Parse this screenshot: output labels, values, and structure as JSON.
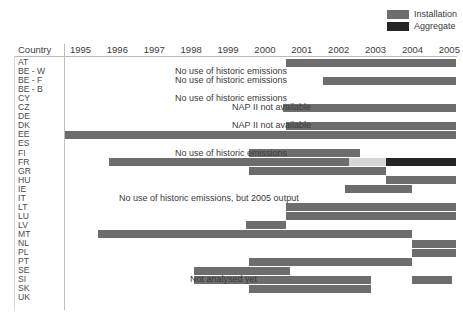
{
  "legend": {
    "items": [
      {
        "label": "Installation",
        "color": "#6d6d6d",
        "key": "installation"
      },
      {
        "label": "Aggregate",
        "color": "#252525",
        "key": "aggregate"
      }
    ]
  },
  "axis": {
    "country_header": "Country",
    "years": [
      "1995",
      "1996",
      "1997",
      "1998",
      "1999",
      "2000",
      "2001",
      "2002",
      "2003",
      "2004",
      "2005"
    ],
    "x_min": 1995,
    "x_max": 2005.6
  },
  "chart_data": {
    "type": "bar",
    "orientation": "horizontal-gantt",
    "title": "",
    "xlabel": "",
    "ylabel": "Country",
    "xlim": [
      1995,
      2005.6
    ],
    "grid": false,
    "legend_position": "top-right",
    "categories": [
      "AT",
      "BE - W",
      "BE - F",
      "BE - B",
      "CY",
      "CZ",
      "DE",
      "DK",
      "EE",
      "ES",
      "FI",
      "FR",
      "GR",
      "HU",
      "IE",
      "IT",
      "LT",
      "LU",
      "LV",
      "MT",
      "NL",
      "PL",
      "PT",
      "SE",
      "SI",
      "SK",
      "UK"
    ],
    "series": [
      {
        "name": "Installation",
        "color": "#6d6d6d"
      },
      {
        "name": "Aggregate",
        "color": "#252525"
      },
      {
        "name": "Light",
        "color": "#d6d6d6"
      }
    ],
    "bars": [
      {
        "country": "AT",
        "start": 2001.0,
        "end": 2005.6,
        "series": "Installation"
      },
      {
        "country": "BE - F",
        "start": 2002.0,
        "end": 2005.6,
        "series": "Installation"
      },
      {
        "country": "CZ",
        "start": 2000.9,
        "end": 2005.6,
        "series": "Installation"
      },
      {
        "country": "DK",
        "start": 2001.0,
        "end": 2005.6,
        "series": "Installation"
      },
      {
        "country": "EE",
        "start": 1995.0,
        "end": 2005.6,
        "series": "Installation"
      },
      {
        "country": "FI",
        "start": 2000.0,
        "end": 2003.0,
        "series": "Installation"
      },
      {
        "country": "FR",
        "start": 1996.2,
        "end": 2000.0,
        "series": "Installation"
      },
      {
        "country": "FR",
        "start": 2000.0,
        "end": 2002.7,
        "series": "Installation"
      },
      {
        "country": "FR",
        "start": 2002.7,
        "end": 2003.7,
        "series": "Light"
      },
      {
        "country": "FR",
        "start": 2003.7,
        "end": 2005.6,
        "series": "Aggregate"
      },
      {
        "country": "GR",
        "start": 2000.0,
        "end": 2003.7,
        "series": "Installation"
      },
      {
        "country": "HU",
        "start": 2003.7,
        "end": 2005.6,
        "series": "Installation"
      },
      {
        "country": "IE",
        "start": 2002.6,
        "end": 2004.4,
        "series": "Installation"
      },
      {
        "country": "LT",
        "start": 2001.0,
        "end": 2005.6,
        "series": "Installation"
      },
      {
        "country": "LU",
        "start": 2001.0,
        "end": 2005.6,
        "series": "Installation"
      },
      {
        "country": "LV",
        "start": 1999.9,
        "end": 2001.0,
        "series": "Installation"
      },
      {
        "country": "MT",
        "start": 1995.9,
        "end": 2004.4,
        "series": "Installation"
      },
      {
        "country": "MT",
        "start": 1999.9,
        "end": 2001.0,
        "series": "Installation"
      },
      {
        "country": "NL",
        "start": 2004.4,
        "end": 2005.6,
        "series": "Installation"
      },
      {
        "country": "PL",
        "start": 2004.4,
        "end": 2005.6,
        "series": "Installation"
      },
      {
        "country": "PT",
        "start": 2000.0,
        "end": 2004.4,
        "series": "Installation"
      },
      {
        "country": "SE",
        "start": 1998.5,
        "end": 2001.1,
        "series": "Installation"
      },
      {
        "country": "SI",
        "start": 1998.5,
        "end": 2003.3,
        "series": "Installation"
      },
      {
        "country": "SI",
        "start": 2004.4,
        "end": 2005.5,
        "series": "Installation"
      },
      {
        "country": "SK",
        "start": 2000.0,
        "end": 2003.3,
        "series": "Installation"
      }
    ],
    "annotations": [
      {
        "text": "No use of historic emissions",
        "country": "BE - W",
        "x": 1999.5
      },
      {
        "text": "No use of historic emissions",
        "country": "BE - F",
        "x": 1999.5
      },
      {
        "text": "No use of historic emissions",
        "country": "CY",
        "x": 1999.5
      },
      {
        "text": "NAP II not available",
        "country": "CZ",
        "x": 2000.6
      },
      {
        "text": "NAP II not available",
        "country": "DK",
        "x": 2000.6
      },
      {
        "text": "No use of historic emissions",
        "country": "FI",
        "x": 1999.5
      },
      {
        "text": "No use of historic emissions, but 2005 output",
        "country": "IT",
        "x": 1998.9
      },
      {
        "text": "Not analysed yet",
        "country": "SI",
        "x": 1999.3
      }
    ]
  }
}
